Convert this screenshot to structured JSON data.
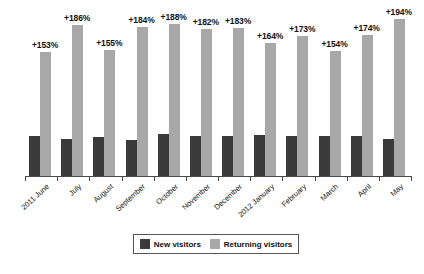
{
  "chart_data": {
    "type": "bar",
    "title": "",
    "subtitle": "",
    "xlabel": "",
    "ylabel": "",
    "grid": false,
    "legend_position": "bottom",
    "ylim": [
      0,
      200
    ],
    "categories": [
      "2011 June",
      "July",
      "August",
      "September",
      "October",
      "November",
      "December",
      "2012 January",
      "February",
      "March",
      "April",
      "May"
    ],
    "series": [
      {
        "name": "New  visitors",
        "color": "#3a3a3a",
        "values": [
          50,
          46,
          48,
          45,
          52,
          50,
          50,
          51,
          50,
          50,
          49,
          46
        ]
      },
      {
        "name": "Returning visitors",
        "color": "#a8a8a8",
        "values": [
          153,
          186,
          155,
          184,
          188,
          182,
          183,
          164,
          173,
          154,
          174,
          194
        ]
      }
    ],
    "data_labels": [
      "+153%",
      "+186%",
      "+155%",
      "+184%",
      "+188%",
      "+182%",
      "+183%",
      "+164%",
      "+173%",
      "+154%",
      "+174%",
      "+194%"
    ]
  },
  "legend": {
    "items": [
      {
        "label": "New  visitors",
        "swatch": "new"
      },
      {
        "label": "Returning visitors",
        "swatch": "ret"
      }
    ]
  },
  "colors": {
    "new_visitors": "#3a3a3a",
    "returning_visitors": "#a8a8a8",
    "axis": "#4a4a4a",
    "background": "#ffffff",
    "text": "#111111"
  }
}
